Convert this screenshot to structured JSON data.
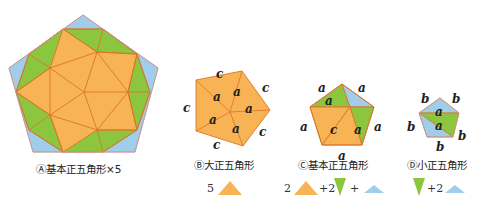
{
  "colors": {
    "orange": "#f8b454",
    "green": "#8cc63f",
    "blue": "#9fcdea",
    "edge": "#d9742b"
  },
  "figures": [
    {
      "id": "A",
      "caption": "Ⓐ基本正五角形×5"
    },
    {
      "id": "B",
      "caption": "Ⓑ大正五角形",
      "formula": {
        "coef1": "5"
      },
      "edge_labels": [
        "c",
        "c",
        "c",
        "c",
        "c"
      ],
      "inner_labels": [
        "a",
        "a",
        "a",
        "a",
        "a"
      ]
    },
    {
      "id": "C",
      "caption": "Ⓒ基本正五角形",
      "formula": {
        "coef1": "2",
        "op1": "+2",
        "op2": "+"
      },
      "edge_labels": [
        "a",
        "a",
        "a",
        "a",
        "a"
      ],
      "inner_labels": [
        "a",
        "c",
        "a"
      ]
    },
    {
      "id": "D",
      "caption": "Ⓓ小正五角形",
      "formula": {
        "op1": "+2"
      },
      "edge_labels": [
        "b",
        "b",
        "b",
        "b",
        "b"
      ],
      "inner_labels": [
        "a",
        "a"
      ]
    }
  ]
}
